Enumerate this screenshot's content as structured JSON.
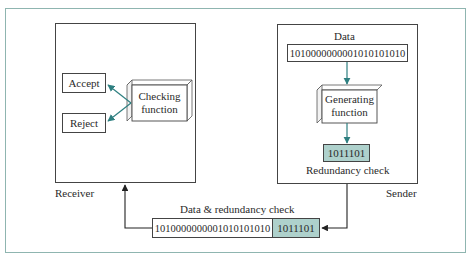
{
  "diagram": {
    "receiver": {
      "label": "Receiver",
      "accept_label": "Accept",
      "reject_label": "Reject",
      "checking_function": {
        "line1": "Checking",
        "line2": "function"
      }
    },
    "sender": {
      "label": "Sender",
      "data_title": "Data",
      "data_bits": "1010000000001010101010",
      "generating_function": {
        "line1": "Generating",
        "line2": "function"
      },
      "redundancy_bits": "1011101",
      "redundancy_label": "Redundancy check"
    },
    "transmission": {
      "title": "Data & redundancy check",
      "data_bits": "1010000000001010101010",
      "redundancy_bits": "1011101"
    },
    "colors": {
      "frame": "#8fb5b0",
      "redundancy_fill": "#aed1cc",
      "arrow_teal": "#2e7f80",
      "arrow_black": "#222222"
    }
  }
}
